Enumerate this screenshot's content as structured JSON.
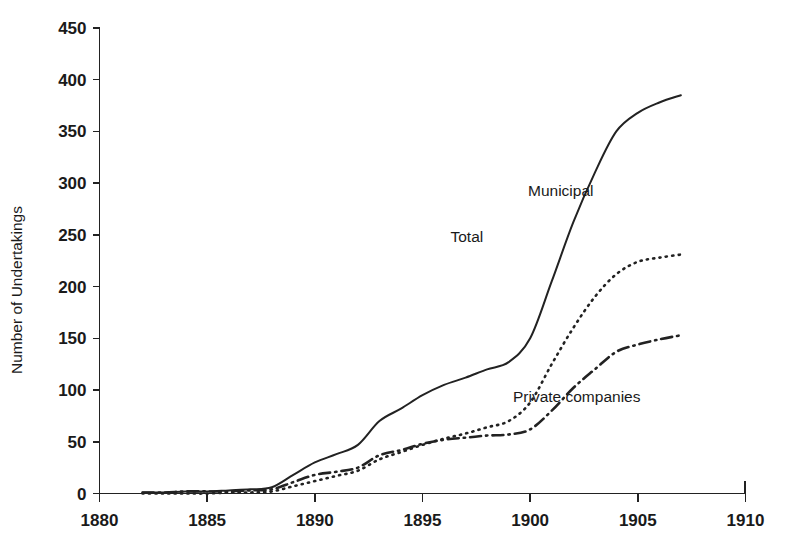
{
  "chart_data": {
    "type": "line",
    "title": "",
    "subtitle": "",
    "xlabel": "",
    "ylabel": "Number of Undertakings",
    "xlim": [
      1880,
      1910
    ],
    "ylim": [
      0,
      450
    ],
    "xticks": [
      1880,
      1885,
      1890,
      1895,
      1900,
      1905,
      1910
    ],
    "yticks": [
      0,
      50,
      100,
      150,
      200,
      250,
      300,
      350,
      400,
      450
    ],
    "grid": false,
    "legend_position": "inline-annotations",
    "x": [
      1882,
      1883,
      1884,
      1885,
      1886,
      1887,
      1888,
      1889,
      1890,
      1891,
      1892,
      1893,
      1894,
      1895,
      1896,
      1897,
      1898,
      1899,
      1900,
      1901,
      1902,
      1903,
      1904,
      1905,
      1906,
      1907
    ],
    "series": [
      {
        "name": "Total",
        "line_style": "solid",
        "values": [
          1,
          1,
          2,
          2,
          3,
          4,
          6,
          18,
          30,
          38,
          47,
          70,
          82,
          95,
          105,
          112,
          120,
          127,
          150,
          205,
          262,
          310,
          350,
          368,
          378,
          385
        ]
      },
      {
        "name": "Municipal",
        "line_style": "dotted",
        "values": [
          0,
          0,
          0,
          0,
          1,
          1,
          2,
          7,
          12,
          17,
          22,
          33,
          40,
          47,
          53,
          58,
          64,
          70,
          88,
          125,
          160,
          190,
          212,
          224,
          228,
          231
        ]
      },
      {
        "name": "Private companies",
        "line_style": "dash-dot",
        "values": [
          1,
          1,
          2,
          2,
          2,
          3,
          4,
          11,
          18,
          21,
          25,
          37,
          42,
          48,
          52,
          54,
          56,
          57,
          62,
          80,
          102,
          120,
          137,
          144,
          149,
          153
        ]
      }
    ],
    "annotations": [
      {
        "text": "Total",
        "x": 1896.3,
        "y": 243
      },
      {
        "text": "Municipal",
        "x": 1899.9,
        "y": 288
      },
      {
        "text": "Private companies",
        "x": 1899.2,
        "y": 88
      }
    ]
  },
  "axes": {
    "y_title": "Number of Undertakings",
    "y_tick_labels": [
      "0",
      "50",
      "100",
      "150",
      "200",
      "250",
      "300",
      "350",
      "400",
      "450"
    ],
    "x_tick_labels": [
      "1880",
      "1885",
      "1890",
      "1895",
      "1900",
      "1905",
      "1910"
    ]
  },
  "colors": {
    "background": "#ffffff",
    "axis": "#222222",
    "text": "#1a1a1a",
    "series": "#222222"
  }
}
